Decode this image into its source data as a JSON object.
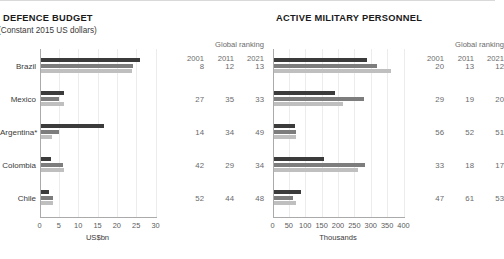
{
  "meta": {
    "ranking_header": "Global ranking",
    "ranking_years": [
      "2001",
      "2011",
      "2021"
    ],
    "series_colors": [
      "#3b3b3b",
      "#7d7d7d",
      "#bfbfbf"
    ],
    "series_names": [
      "2001",
      "2011",
      "2021"
    ]
  },
  "panels": {
    "left": {
      "title": "DEFENCE BUDGET",
      "subtitle": "(Constant 2015 US dollars)",
      "axis_title": "US$bn"
    },
    "right": {
      "title": "ACTIVE MILITARY PERSONNEL",
      "subtitle": "",
      "axis_title": "Thousands"
    }
  },
  "chart_data": [
    {
      "type": "bar",
      "orientation": "horizontal",
      "panel": "left",
      "title": "DEFENCE BUDGET",
      "subtitle": "(Constant 2015 US dollars)",
      "xlabel": "US$bn",
      "ylabel": "",
      "xlim": [
        0,
        30
      ],
      "xticks": [
        0,
        5,
        10,
        15,
        20,
        25,
        30
      ],
      "xtick_labels": [
        "0",
        "5",
        "10",
        "15",
        "20",
        "25",
        "30"
      ],
      "grid": true,
      "legend_position": "none",
      "categories": [
        "Brazil",
        "Mexico",
        "Argentina*",
        "Colombia",
        "Chile"
      ],
      "series": [
        {
          "name": "2001",
          "color": "#3b3b3b",
          "values": [
            26.0,
            6.3,
            16.6,
            3.1,
            2.4
          ]
        },
        {
          "name": "2011",
          "color": "#7d7d7d",
          "values": [
            24.2,
            5.0,
            5.0,
            6.0,
            3.6
          ]
        },
        {
          "name": "2021",
          "color": "#bfbfbf",
          "values": [
            23.8,
            6.3,
            3.2,
            6.4,
            3.5
          ]
        }
      ],
      "ranking": {
        "header": "Global ranking",
        "years": [
          "2001",
          "2011",
          "2021"
        ],
        "rows": [
          {
            "category": "Brazil",
            "values": [
              "8",
              "12",
              "13"
            ]
          },
          {
            "category": "Mexico",
            "values": [
              "27",
              "35",
              "33"
            ]
          },
          {
            "category": "Argentina*",
            "values": [
              "14",
              "34",
              "49"
            ]
          },
          {
            "category": "Colombia",
            "values": [
              "42",
              "29",
              "34"
            ]
          },
          {
            "category": "Chile",
            "values": [
              "52",
              "44",
              "48"
            ]
          }
        ]
      }
    },
    {
      "type": "bar",
      "orientation": "horizontal",
      "panel": "right",
      "title": "ACTIVE MILITARY PERSONNEL",
      "subtitle": "",
      "xlabel": "Thousands",
      "ylabel": "",
      "xlim": [
        0,
        400
      ],
      "xticks": [
        0,
        50,
        100,
        150,
        200,
        250,
        300,
        350,
        400
      ],
      "xtick_labels": [
        "0",
        "50",
        "100",
        "150",
        "200",
        "250",
        "300",
        "350",
        "400"
      ],
      "grid": true,
      "legend_position": "none",
      "categories": [
        "Brazil",
        "Mexico",
        "Argentina*",
        "Colombia",
        "Chile"
      ],
      "series": [
        {
          "name": "2001",
          "color": "#3b3b3b",
          "values": [
            288,
            192,
            70,
            158,
            88
          ]
        },
        {
          "name": "2011",
          "color": "#7d7d7d",
          "values": [
            318,
            280,
            73,
            283,
            62
          ]
        },
        {
          "name": "2021",
          "color": "#bfbfbf",
          "values": [
            362,
            215,
            72,
            262,
            72
          ]
        }
      ],
      "ranking": {
        "header": "Global ranking",
        "years": [
          "2001",
          "2011",
          "2021"
        ],
        "rows": [
          {
            "category": "Brazil",
            "values": [
              "20",
              "13",
              "12"
            ]
          },
          {
            "category": "Mexico",
            "values": [
              "29",
              "19",
              "20"
            ]
          },
          {
            "category": "Argentina*",
            "values": [
              "56",
              "52",
              "51"
            ]
          },
          {
            "category": "Colombia",
            "values": [
              "33",
              "18",
              "17"
            ]
          },
          {
            "category": "Chile",
            "values": [
              "47",
              "61",
              "53"
            ]
          }
        ]
      }
    }
  ]
}
